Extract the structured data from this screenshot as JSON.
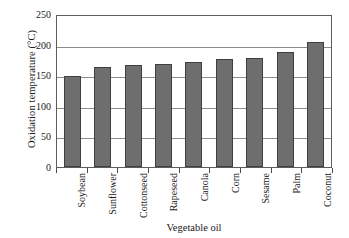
{
  "chart_data": {
    "type": "bar",
    "title": "",
    "xlabel": "Vegetable oil",
    "ylabel": "Oxidation temperature (°C)",
    "categories": [
      "Soybean",
      "Sunflower",
      "Cottonseed",
      "Rapeseed",
      "Canola",
      "Corn",
      "Sesame",
      "Palm",
      "Coconut"
    ],
    "values": [
      148,
      164,
      166,
      168,
      171,
      177,
      178,
      188,
      205
    ],
    "ylim": [
      0,
      250
    ],
    "yticks": [
      0,
      50,
      100,
      150,
      200,
      250
    ],
    "ytick_labels": [
      "0",
      "50",
      "100",
      "150",
      "200",
      "250"
    ],
    "grid": true,
    "legend": "none",
    "series_name": "Oxidation temperature",
    "bar_color": "#6e6e6e",
    "bar_edge_color": "#3f3f3f",
    "grid_color": "#8c8c8c",
    "frame_color": "#5d5d5d"
  }
}
